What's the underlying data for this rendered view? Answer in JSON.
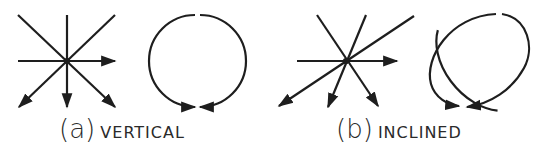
{
  "figures": [
    {
      "id": "a",
      "letter": "(a)",
      "caption": "VERTICAL",
      "shape": "circle"
    },
    {
      "id": "b",
      "letter": "(b)",
      "caption": "INCLINED",
      "shape": "ellipse"
    }
  ],
  "colors": {
    "stroke": "#1e1e1e",
    "text": "#2a2a2a",
    "background": "#ffffff"
  }
}
